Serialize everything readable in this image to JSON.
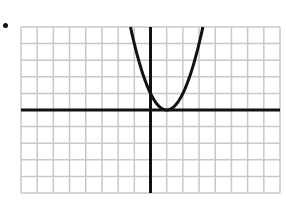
{
  "bullet": "•",
  "chart_data": {
    "type": "line",
    "title": "",
    "xlabel": "",
    "ylabel": "",
    "grid": true,
    "grid_cols": 16,
    "grid_rows": 10,
    "xlim": [
      -8,
      8
    ],
    "ylim": [
      -5,
      5
    ],
    "series": [
      {
        "name": "y = (x - 1)^2",
        "equation": "y = (x-1)^2",
        "vertex": [
          1,
          0
        ],
        "y_intercept": 1,
        "x": [
          -1.2,
          -1,
          -0.5,
          0,
          0.5,
          1,
          1.5,
          2,
          2.5,
          3,
          3.2
        ],
        "y": [
          4.84,
          4,
          2.25,
          1,
          0.25,
          0,
          0.25,
          1,
          2.25,
          4,
          4.84
        ]
      }
    ],
    "colors": {
      "grid": "#c8c8c8",
      "axes": "#111111",
      "curve": "#111111"
    }
  }
}
